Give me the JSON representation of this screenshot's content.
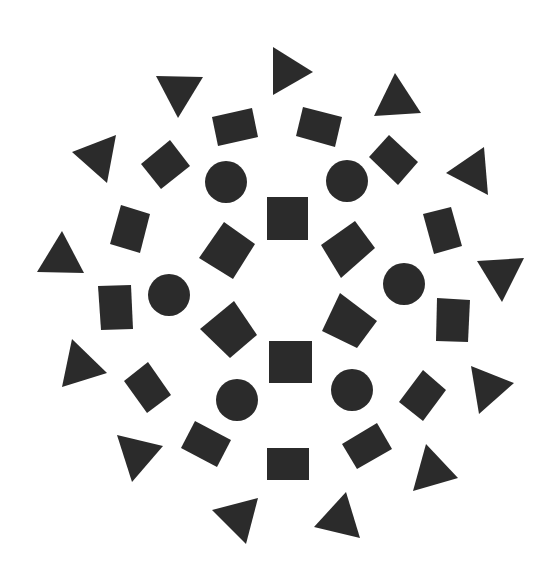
{
  "canvas": {
    "width": 559,
    "height": 572,
    "background": "#ffffff",
    "fill": "#2b2b2b"
  },
  "shapes": [
    {
      "name": "triangle-down-top-left",
      "type": "polygon",
      "points": "156,76 203,77 178,118"
    },
    {
      "name": "triangle-right-top",
      "type": "polygon",
      "points": "273,47 313,72 273,95"
    },
    {
      "name": "triangle-up-top-right",
      "type": "polygon",
      "points": "374,116 395,73 421,113"
    },
    {
      "name": "triangle-left-upper-left",
      "type": "polygon",
      "points": "72,152 116,135 107,183"
    },
    {
      "name": "triangle-left-upper-right",
      "type": "polygon",
      "points": "446,173 484,147 488,195"
    },
    {
      "name": "triangle-up-left",
      "type": "polygon",
      "points": "37,272 62,231 84,273"
    },
    {
      "name": "triangle-down-right",
      "type": "polygon",
      "points": "477,261 524,258 502,302"
    },
    {
      "name": "triangle-left-lower-left",
      "type": "polygon",
      "points": "62,387 72,339 107,373"
    },
    {
      "name": "triangle-right-lower-right",
      "type": "polygon",
      "points": "471,366 514,383 479,414"
    },
    {
      "name": "triangle-down-bottom-left",
      "type": "polygon",
      "points": "117,435 163,446 132,482"
    },
    {
      "name": "triangle-up-bottom-right",
      "type": "polygon",
      "points": "413,491 426,444 458,478"
    },
    {
      "name": "triangle-left-bottom",
      "type": "polygon",
      "points": "212,510 258,498 246,544"
    },
    {
      "name": "triangle-up-bottom",
      "type": "polygon",
      "points": "314,527 346,492 360,538"
    },
    {
      "name": "rect-top-left",
      "type": "polygon",
      "points": "212,117 252,108 258,137 218,146"
    },
    {
      "name": "rect-top-right",
      "type": "polygon",
      "points": "303,107 342,117 335,147 296,136"
    },
    {
      "name": "diamond-upper-left",
      "type": "polygon",
      "points": "170,140 190,166 161,189 141,164"
    },
    {
      "name": "diamond-upper-right",
      "type": "polygon",
      "points": "389,135 418,162 398,185 369,157"
    },
    {
      "name": "rect-left-upper",
      "type": "polygon",
      "points": "121,205 150,214 140,253 110,244"
    },
    {
      "name": "rect-right-upper",
      "type": "polygon",
      "points": "423,214 451,207 462,246 434,254"
    },
    {
      "name": "rect-left-middle",
      "type": "polygon",
      "points": "98,286 131,285 133,329 101,330"
    },
    {
      "name": "rect-right-middle",
      "type": "polygon",
      "points": "437,298 470,300 468,342 436,341"
    },
    {
      "name": "rect-left-lower",
      "type": "polygon",
      "points": "148,362 171,395 147,413 124,381"
    },
    {
      "name": "rect-right-lower",
      "type": "polygon",
      "points": "423,370 446,390 423,421 399,402"
    },
    {
      "name": "rect-bottom-left",
      "type": "polygon",
      "points": "195,421 231,440 217,467 181,448"
    },
    {
      "name": "rect-bottom-right",
      "type": "polygon",
      "points": "377,423 392,449 357,469 342,444"
    },
    {
      "name": "rect-bottom",
      "type": "polygon",
      "points": "267,448 309,448 309,480 267,480"
    },
    {
      "name": "square-center-top",
      "type": "polygon",
      "points": "267,197 308,197 308,240 267,240"
    },
    {
      "name": "square-center-bottom",
      "type": "polygon",
      "points": "269,341 312,341 312,383 269,383"
    },
    {
      "name": "square-rotated-upper-left",
      "type": "polygon",
      "points": "224,222 255,244 233,279 199,258"
    },
    {
      "name": "square-rotated-upper-right",
      "type": "polygon",
      "points": "355,221 375,248 341,278 321,245"
    },
    {
      "name": "square-rotated-lower-left",
      "type": "polygon",
      "points": "234,301 257,335 230,358 200,329"
    },
    {
      "name": "square-rotated-lower-right",
      "type": "polygon",
      "points": "340,293 377,321 357,348 322,331"
    },
    {
      "name": "circle-upper-left",
      "type": "circle",
      "cx": 226,
      "cy": 182,
      "r": 21
    },
    {
      "name": "circle-upper-right",
      "type": "circle",
      "cx": 347,
      "cy": 181,
      "r": 21
    },
    {
      "name": "circle-left",
      "type": "circle",
      "cx": 169,
      "cy": 295,
      "r": 21
    },
    {
      "name": "circle-right",
      "type": "circle",
      "cx": 404,
      "cy": 284,
      "r": 21
    },
    {
      "name": "circle-lower-left",
      "type": "circle",
      "cx": 237,
      "cy": 400,
      "r": 21
    },
    {
      "name": "circle-lower-right",
      "type": "circle",
      "cx": 352,
      "cy": 390,
      "r": 21
    }
  ]
}
